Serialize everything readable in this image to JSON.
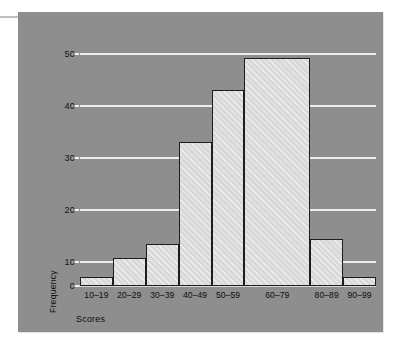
{
  "figure": {
    "background_color": "#ffffff",
    "panel_color": "#8e8e8e",
    "gridline_color": "#efefef",
    "bar_fill_color": "#d9d9d9",
    "bar_edge_color": "#1d1d1d"
  },
  "chart_data": {
    "type": "bar",
    "title": "",
    "subtitle": "",
    "xlabel": "Scores",
    "ylabel": "Frequency",
    "categories": [
      "10–19",
      "20–29",
      "30–39",
      "40–49",
      "50–59",
      "60–79",
      "80–89",
      "90–99"
    ],
    "values": [
      2,
      6,
      9,
      31,
      42,
      49,
      10,
      2
    ],
    "bin_widths": [
      1,
      1,
      1,
      1,
      1,
      2,
      1,
      1
    ],
    "ylim": [
      0,
      50
    ],
    "yticks": [
      0,
      10,
      20,
      30,
      40,
      50
    ],
    "ytick_labels": [
      "0",
      "10",
      "20",
      "30",
      "40",
      "50"
    ],
    "grid": true,
    "grid_axis": "y",
    "legend": false,
    "legend_position": "none",
    "annotations": []
  }
}
